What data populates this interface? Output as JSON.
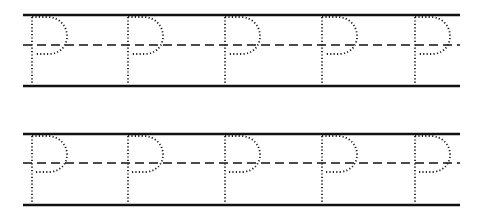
{
  "worksheet": {
    "letter": "P",
    "rows": [
      {
        "top_y": 15,
        "mid_y": 45,
        "bottom_y": 86
      },
      {
        "top_y": 134,
        "mid_y": 163,
        "bottom_y": 205
      }
    ],
    "letter_x": [
      32,
      128,
      225,
      322,
      415
    ],
    "line_x_start": 23,
    "line_x_end": 460,
    "colors": {
      "line": "#111111",
      "dots": "#222222",
      "background": "#ffffff"
    }
  }
}
